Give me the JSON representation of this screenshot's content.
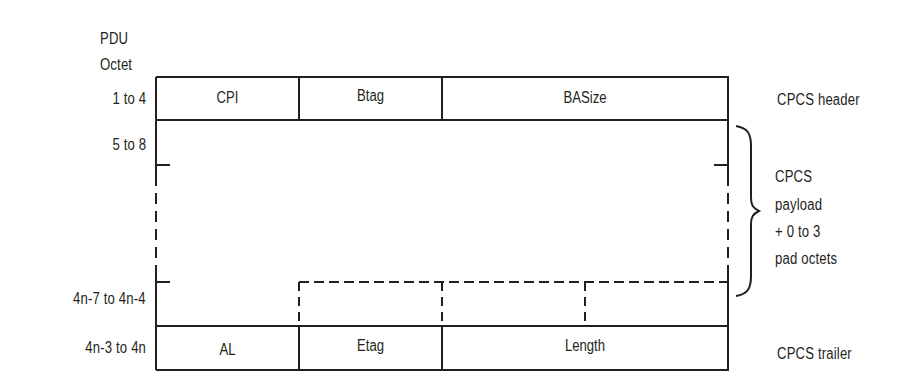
{
  "diagram": {
    "octet_axis": {
      "heading_line1": "PDU",
      "heading_line2": "Octet",
      "rows": [
        "1 to 4",
        "5 to 8",
        "4n-7 to 4n-4",
        "4n-3 to 4n"
      ]
    },
    "header_fields": [
      "CPI",
      "Btag",
      "BASize"
    ],
    "trailer_fields": [
      "AL",
      "Etag",
      "Length"
    ],
    "annotations": {
      "header": "CPCS header",
      "payload_line1": "CPCS",
      "payload_line2": "payload",
      "payload_line3": "+ 0 to 3",
      "payload_line4": "pad octets",
      "trailer": "CPCS trailer"
    },
    "line_color": "#231f20"
  }
}
